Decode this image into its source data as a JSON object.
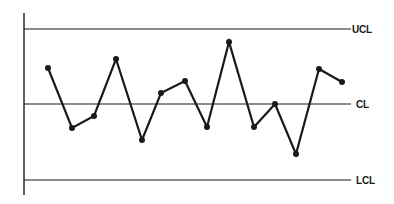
{
  "chart_data": {
    "type": "line",
    "title": "",
    "xlabel": "",
    "ylabel": "",
    "grid": false,
    "legend": false,
    "x": [
      1,
      2,
      3,
      4,
      5,
      6,
      7,
      8,
      9,
      10,
      11,
      12,
      13,
      14
    ],
    "series": [
      {
        "name": "Process",
        "values": [
          1.44,
          -0.96,
          -0.48,
          1.8,
          -1.44,
          0.44,
          0.92,
          -0.92,
          2.48,
          -0.92,
          0.0,
          -2.0,
          1.4,
          0.88
        ]
      }
    ],
    "control_limits": {
      "UCL": {
        "label": "UCL",
        "value": 3.0
      },
      "CL": {
        "label": "CL",
        "value": 0.0
      },
      "LCL": {
        "label": "LCL",
        "value": -3.0
      }
    },
    "ylim": [
      -3.6,
      3.64
    ]
  },
  "labels": {
    "ucl": "UCL",
    "cl": "CL",
    "lcl": "LCL"
  },
  "colors": {
    "line": "#1a1a1a",
    "background": "#ffffff"
  }
}
